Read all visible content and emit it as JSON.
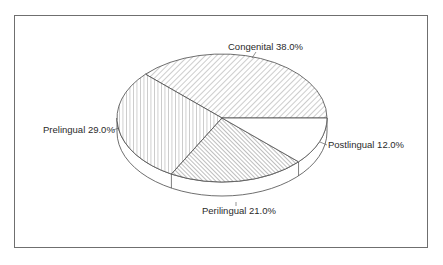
{
  "chart_data": {
    "type": "pie",
    "style": "3d-pie-with-hatching",
    "title": "",
    "slices": [
      {
        "label": "Congenital",
        "value": 38.0,
        "display": "Congenital  38.0%",
        "pattern": "diag-right"
      },
      {
        "label": "Postlingual",
        "value": 12.0,
        "display": "Postlingual  12.0%",
        "pattern": "none"
      },
      {
        "label": "Perilingual",
        "value": 21.0,
        "display": "Perilingual  21.0%",
        "pattern": "diag-left"
      },
      {
        "label": "Prelingual",
        "value": 29.0,
        "display": "Prelingual  29.0%",
        "pattern": "vertical"
      }
    ],
    "legend": "none",
    "labels_position": "outside with leader lines"
  },
  "colors": {
    "line": "#4a4a4a",
    "frame": "#6f6f6f",
    "text": "#2a2a2a",
    "background": "#ffffff"
  }
}
